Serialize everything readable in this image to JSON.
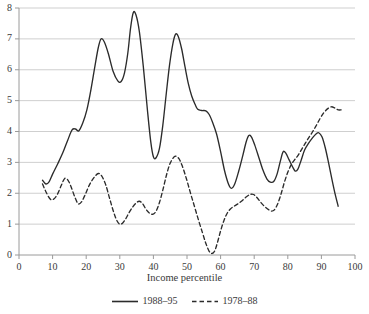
{
  "chart_data": {
    "type": "line",
    "title": "",
    "subtitle": "",
    "xlabel": "Income percentile",
    "ylabel": "",
    "xlim": [
      0,
      100
    ],
    "ylim": [
      0,
      8
    ],
    "grid": "horizontal",
    "legend_position": "bottom-center",
    "x_ticks": [
      0,
      10,
      20,
      30,
      40,
      50,
      60,
      70,
      80,
      90,
      100
    ],
    "y_ticks": [
      0,
      1,
      2,
      3,
      4,
      5,
      6,
      7,
      8
    ],
    "x_tick_labels": [
      "0",
      "10",
      "20",
      "30",
      "40",
      "50",
      "60",
      "70",
      "80",
      "90",
      "100"
    ],
    "y_tick_labels": [
      "0",
      "1",
      "2",
      "3",
      "4",
      "5",
      "6",
      "7",
      "8"
    ],
    "series": [
      {
        "name": "1988–95",
        "style": "solid",
        "color": "#2b2b2b",
        "points": [
          [
            7.0,
            2.42
          ],
          [
            8.0,
            2.3
          ],
          [
            9.0,
            2.38
          ],
          [
            10.0,
            2.62
          ],
          [
            11.5,
            2.95
          ],
          [
            13.0,
            3.3
          ],
          [
            14.5,
            3.72
          ],
          [
            15.8,
            4.05
          ],
          [
            16.8,
            4.08
          ],
          [
            17.8,
            4.02
          ],
          [
            19.0,
            4.28
          ],
          [
            20.2,
            4.7
          ],
          [
            21.4,
            5.35
          ],
          [
            22.6,
            6.12
          ],
          [
            23.6,
            6.72
          ],
          [
            24.4,
            7.0
          ],
          [
            25.4,
            6.9
          ],
          [
            26.6,
            6.52
          ],
          [
            28.0,
            5.95
          ],
          [
            29.4,
            5.64
          ],
          [
            30.4,
            5.62
          ],
          [
            31.4,
            5.9
          ],
          [
            32.4,
            6.55
          ],
          [
            33.2,
            7.35
          ],
          [
            34.0,
            7.85
          ],
          [
            34.8,
            7.78
          ],
          [
            35.8,
            7.25
          ],
          [
            37.0,
            6.1
          ],
          [
            38.2,
            4.72
          ],
          [
            39.2,
            3.68
          ],
          [
            40.0,
            3.18
          ],
          [
            40.8,
            3.15
          ],
          [
            41.8,
            3.45
          ],
          [
            42.8,
            4.2
          ],
          [
            43.8,
            5.2
          ],
          [
            44.8,
            6.15
          ],
          [
            45.8,
            6.85
          ],
          [
            46.6,
            7.15
          ],
          [
            47.4,
            7.08
          ],
          [
            48.4,
            6.68
          ],
          [
            49.4,
            6.1
          ],
          [
            50.4,
            5.55
          ],
          [
            51.4,
            5.15
          ],
          [
            52.4,
            4.88
          ],
          [
            53.2,
            4.72
          ],
          [
            54.4,
            4.68
          ],
          [
            55.6,
            4.67
          ],
          [
            56.6,
            4.55
          ],
          [
            57.6,
            4.3
          ],
          [
            58.8,
            3.92
          ],
          [
            60.0,
            3.35
          ],
          [
            61.2,
            2.72
          ],
          [
            62.4,
            2.28
          ],
          [
            63.2,
            2.16
          ],
          [
            64.2,
            2.3
          ],
          [
            65.4,
            2.72
          ],
          [
            66.6,
            3.22
          ],
          [
            67.6,
            3.66
          ],
          [
            68.4,
            3.87
          ],
          [
            69.2,
            3.82
          ],
          [
            70.2,
            3.55
          ],
          [
            71.4,
            3.15
          ],
          [
            72.6,
            2.75
          ],
          [
            73.8,
            2.46
          ],
          [
            74.8,
            2.36
          ],
          [
            75.8,
            2.38
          ],
          [
            76.8,
            2.62
          ],
          [
            77.8,
            3.05
          ],
          [
            78.6,
            3.34
          ],
          [
            79.4,
            3.3
          ],
          [
            80.4,
            3.08
          ],
          [
            81.4,
            2.86
          ],
          [
            82.2,
            2.72
          ],
          [
            83.0,
            2.78
          ],
          [
            84.0,
            3.08
          ],
          [
            85.0,
            3.4
          ],
          [
            86.2,
            3.62
          ],
          [
            87.4,
            3.8
          ],
          [
            88.4,
            3.92
          ],
          [
            89.2,
            3.96
          ],
          [
            90.2,
            3.82
          ],
          [
            91.2,
            3.45
          ],
          [
            92.2,
            2.95
          ],
          [
            93.2,
            2.42
          ],
          [
            94.2,
            1.92
          ],
          [
            95.0,
            1.58
          ]
        ]
      },
      {
        "name": "1978–88",
        "style": "dashed",
        "color": "#2b2b2b",
        "points": [
          [
            7.0,
            2.3
          ],
          [
            8.0,
            2.05
          ],
          [
            9.2,
            1.82
          ],
          [
            10.2,
            1.8
          ],
          [
            11.4,
            1.96
          ],
          [
            12.6,
            2.26
          ],
          [
            13.6,
            2.48
          ],
          [
            14.6,
            2.42
          ],
          [
            15.6,
            2.18
          ],
          [
            16.6,
            1.88
          ],
          [
            17.6,
            1.66
          ],
          [
            18.6,
            1.72
          ],
          [
            19.8,
            1.98
          ],
          [
            21.0,
            2.28
          ],
          [
            22.4,
            2.52
          ],
          [
            23.6,
            2.64
          ],
          [
            24.6,
            2.56
          ],
          [
            25.8,
            2.28
          ],
          [
            27.0,
            1.82
          ],
          [
            28.2,
            1.38
          ],
          [
            29.2,
            1.1
          ],
          [
            30.0,
            1.0
          ],
          [
            30.8,
            1.03
          ],
          [
            31.8,
            1.18
          ],
          [
            32.8,
            1.38
          ],
          [
            33.8,
            1.55
          ],
          [
            34.8,
            1.68
          ],
          [
            35.8,
            1.74
          ],
          [
            36.8,
            1.66
          ],
          [
            37.8,
            1.48
          ],
          [
            38.8,
            1.36
          ],
          [
            39.8,
            1.32
          ],
          [
            40.8,
            1.42
          ],
          [
            41.8,
            1.7
          ],
          [
            42.8,
            2.1
          ],
          [
            43.8,
            2.55
          ],
          [
            44.8,
            2.92
          ],
          [
            45.8,
            3.13
          ],
          [
            46.6,
            3.2
          ],
          [
            47.6,
            3.12
          ],
          [
            48.6,
            2.88
          ],
          [
            49.8,
            2.48
          ],
          [
            51.0,
            2.02
          ],
          [
            52.2,
            1.58
          ],
          [
            53.4,
            1.14
          ],
          [
            54.6,
            0.72
          ],
          [
            55.6,
            0.38
          ],
          [
            56.6,
            0.12
          ],
          [
            57.4,
            0.05
          ],
          [
            58.2,
            0.12
          ],
          [
            59.0,
            0.38
          ],
          [
            60.0,
            0.78
          ],
          [
            61.0,
            1.12
          ],
          [
            62.0,
            1.36
          ],
          [
            63.0,
            1.5
          ],
          [
            64.0,
            1.58
          ],
          [
            65.2,
            1.66
          ],
          [
            66.4,
            1.76
          ],
          [
            67.6,
            1.88
          ],
          [
            68.8,
            1.96
          ],
          [
            69.8,
            1.96
          ],
          [
            70.8,
            1.86
          ],
          [
            72.0,
            1.7
          ],
          [
            73.2,
            1.56
          ],
          [
            74.4,
            1.46
          ],
          [
            75.2,
            1.42
          ],
          [
            76.0,
            1.46
          ],
          [
            77.0,
            1.66
          ],
          [
            78.0,
            1.98
          ],
          [
            79.0,
            2.36
          ],
          [
            80.0,
            2.68
          ],
          [
            81.0,
            2.92
          ],
          [
            82.0,
            3.08
          ],
          [
            83.0,
            3.22
          ],
          [
            84.0,
            3.4
          ],
          [
            85.0,
            3.58
          ],
          [
            86.0,
            3.76
          ],
          [
            87.2,
            3.96
          ],
          [
            88.4,
            4.18
          ],
          [
            89.6,
            4.42
          ],
          [
            90.8,
            4.62
          ],
          [
            92.0,
            4.75
          ],
          [
            93.0,
            4.8
          ],
          [
            94.0,
            4.76
          ],
          [
            95.0,
            4.7
          ],
          [
            96.0,
            4.7
          ]
        ]
      }
    ]
  },
  "legend": {
    "entries": [
      {
        "label": "1988–95",
        "style": "solid"
      },
      {
        "label": "1978–88",
        "style": "dashed"
      }
    ]
  },
  "axis": {
    "x_title": "Income percentile"
  },
  "colors": {
    "line": "#2b2b2b",
    "grid": "#c9c9c9",
    "axis": "#9a9a9a",
    "text": "#3a3a3a",
    "background": "#ffffff"
  }
}
